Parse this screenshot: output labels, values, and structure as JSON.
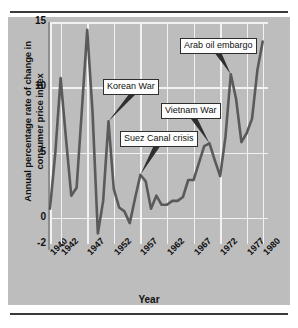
{
  "figure": {
    "ylabel": "Annual percentage rate of change in consumer price index",
    "xlabel": "Year"
  },
  "chart_data": {
    "type": "line",
    "title": "",
    "xlabel": "Year",
    "ylabel": "Annual percentage rate of change in consumer price index",
    "xlim": [
      1940,
      1981
    ],
    "ylim": [
      -2,
      15
    ],
    "yticks": [
      -2,
      0,
      5,
      10,
      15
    ],
    "ytick_labels": [
      "-2",
      "0",
      "5",
      "10",
      "15"
    ],
    "xticks": [
      1940,
      1942,
      1947,
      1952,
      1957,
      1962,
      1967,
      1972,
      1977,
      1980
    ],
    "xtick_labels": [
      "1940",
      "1942",
      "1947",
      "1952",
      "1957",
      "1962",
      "1967",
      "1972",
      "1977",
      "1980"
    ],
    "grid": true,
    "legend": "none",
    "line_color": "#5a5a5a",
    "background_color": "#bdbdbd",
    "gridline_color": "#f2f2f2",
    "x": [
      1940,
      1941,
      1942,
      1943,
      1944,
      1945,
      1946,
      1947,
      1948,
      1949,
      1950,
      1951,
      1952,
      1953,
      1954,
      1955,
      1956,
      1957,
      1958,
      1959,
      1960,
      1961,
      1962,
      1963,
      1964,
      1965,
      1966,
      1967,
      1968,
      1969,
      1970,
      1971,
      1972,
      1973,
      1974,
      1975,
      1976,
      1977,
      1978,
      1979,
      1980
    ],
    "values": [
      0.7,
      5.0,
      10.7,
      6.1,
      1.7,
      2.3,
      8.3,
      14.4,
      8.1,
      -1.2,
      1.3,
      7.4,
      2.2,
      0.8,
      0.5,
      -0.4,
      1.5,
      3.3,
      2.8,
      0.7,
      1.7,
      1.0,
      1.0,
      1.3,
      1.3,
      1.6,
      2.9,
      2.9,
      4.2,
      5.5,
      5.7,
      4.4,
      3.2,
      6.2,
      11.0,
      9.1,
      5.8,
      6.5,
      7.6,
      11.3,
      13.5
    ],
    "annotations": [
      {
        "label": "Korean War",
        "points_to_year": 1951,
        "points_to_value": 7.4
      },
      {
        "label": "Suez Canal crisis",
        "points_to_year": 1957,
        "points_to_value": 3.3
      },
      {
        "label": "Vietnam War",
        "points_to_year": 1970,
        "points_to_value": 5.7
      },
      {
        "label": "Arab oil embargo",
        "points_to_year": 1974,
        "points_to_value": 11.0
      }
    ]
  }
}
